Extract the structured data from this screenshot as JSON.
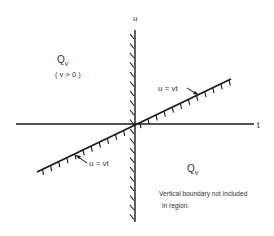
{
  "diagram": {
    "axes": {
      "horizontal_label": "t",
      "vertical_label": "u"
    },
    "upper_region": {
      "name": "Q",
      "subscript": "v",
      "condition": "( v > 0 )"
    },
    "lower_region": {
      "name": "Q",
      "subscript": "v",
      "note_line1": "Vertical boundary not included",
      "note_line2": "in region."
    },
    "boundary_labels": {
      "upper": "u = vt",
      "lower": "u = vt"
    },
    "colors": {
      "line": "#1a1a1a",
      "text": "#333333"
    }
  }
}
